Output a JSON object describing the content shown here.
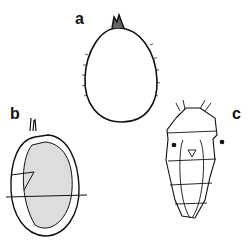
{
  "figure": {
    "panels": [
      {
        "id": "a",
        "label": "a",
        "description": "ovoid egg-like form with apical tuft and fine marginal setae"
      },
      {
        "id": "b",
        "label": "b",
        "description": "stippled ovoid body with apical tuft, lateral spines and internal fold"
      },
      {
        "id": "c",
        "label": "c",
        "description": "segmented larva, dorsal view, with anterior setae, two eye-spots and median structure"
      }
    ],
    "colors": {
      "ink": "#111111",
      "background": "#ffffff"
    }
  }
}
